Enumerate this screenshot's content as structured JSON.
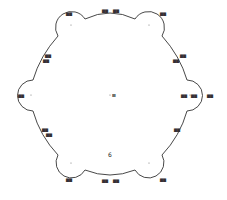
{
  "diagram": {
    "type": "hexagonal arc-bounded figure with vertex circles",
    "center_label": "Ⅲ",
    "center_number": "6",
    "vertex_labels": [
      "▆▆",
      "▆▆",
      "▆▆",
      "▆▆",
      "▆▆",
      "▆▆"
    ],
    "edge_labels": {
      "top": [
        "▆▆",
        "▆▆"
      ],
      "upper_left": [
        "▆▆",
        "▆▆"
      ],
      "upper_right": [
        "▆▆",
        "▆▆"
      ],
      "lower_left": [
        "▆▆",
        "▆▆"
      ],
      "lower_right": [
        "▆▆"
      ],
      "bottom": [
        "▆▆",
        "▆▆"
      ],
      "right_inner": [
        "▆▆",
        "▆▆"
      ]
    },
    "line_color": "#333333"
  }
}
